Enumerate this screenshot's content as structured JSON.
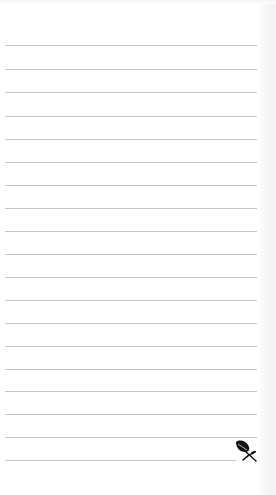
{
  "notepad": {
    "width": 276,
    "height": 495,
    "line_color": "#c6c6c6",
    "background_color": "#ffffff",
    "line_count": 19,
    "lines": [
      {
        "top": 45,
        "right": 257
      },
      {
        "top": 69,
        "right": 257
      },
      {
        "top": 92,
        "right": 257
      },
      {
        "top": 116,
        "right": 257
      },
      {
        "top": 139,
        "right": 257
      },
      {
        "top": 162,
        "right": 257
      },
      {
        "top": 185,
        "right": 257
      },
      {
        "top": 208,
        "right": 257
      },
      {
        "top": 231,
        "right": 257
      },
      {
        "top": 254,
        "right": 257
      },
      {
        "top": 277,
        "right": 257
      },
      {
        "top": 300,
        "right": 257
      },
      {
        "top": 323,
        "right": 257
      },
      {
        "top": 346,
        "right": 257
      },
      {
        "top": 369,
        "right": 257
      },
      {
        "top": 391,
        "right": 257
      },
      {
        "top": 414,
        "right": 257
      },
      {
        "top": 437,
        "right": 257
      },
      {
        "top": 460,
        "right": 236
      }
    ],
    "decoration": {
      "icon": "leaf-icon",
      "color": "#111111"
    }
  }
}
